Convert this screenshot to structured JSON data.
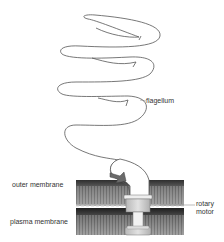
{
  "diagram": {
    "labels": {
      "flagellum": "flagellum",
      "outer_membrane": "outer membrane",
      "plasma_membrane": "plasma membrane",
      "rotary_motor_line1": "rotary",
      "rotary_motor_line2": "motor"
    },
    "colors": {
      "outline": "#555555",
      "membrane_dark": "#3a3a3a",
      "membrane_mid": "#8a8a8a",
      "motor_fill": "#c9c9c9",
      "background": "#ffffff"
    }
  }
}
